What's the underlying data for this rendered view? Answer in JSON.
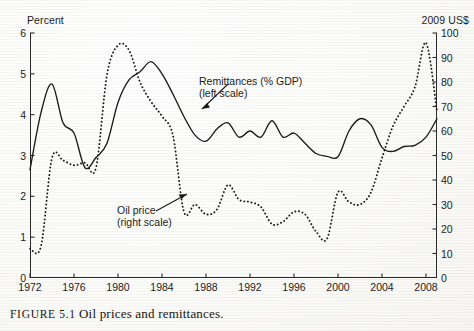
{
  "figure": {
    "caption_label": "FIGURE 5.1",
    "caption_text": "Oil prices and remittances."
  },
  "annotations": {
    "remittances": {
      "line1": "Remittances (% GDP)",
      "line2": "(left scale)"
    },
    "oil": {
      "line1": "Oil price",
      "line2": "(right scale)"
    }
  },
  "chart_data": {
    "type": "line",
    "title": "Oil prices and remittances",
    "xlabel": "",
    "ylabel": "Percent",
    "y2label": "2009 US$",
    "xlim": [
      1972,
      2009
    ],
    "ylim": [
      0,
      6
    ],
    "y2lim": [
      0,
      100
    ],
    "xticks": [
      1972,
      1976,
      1980,
      1984,
      1988,
      1992,
      1996,
      2000,
      2004,
      2008
    ],
    "yticks": [
      0,
      1,
      2,
      3,
      4,
      5,
      6
    ],
    "y2ticks": [
      0,
      10,
      20,
      30,
      40,
      50,
      60,
      70,
      80,
      90,
      100
    ],
    "grid": false,
    "legend": "annotations-inline",
    "x": [
      1972,
      1973,
      1974,
      1975,
      1976,
      1977,
      1978,
      1979,
      1980,
      1981,
      1982,
      1983,
      1984,
      1985,
      1986,
      1987,
      1988,
      1989,
      1990,
      1991,
      1992,
      1993,
      1994,
      1995,
      1996,
      1997,
      1998,
      1999,
      2000,
      2001,
      2002,
      2003,
      2004,
      2005,
      2006,
      2007,
      2008,
      2009
    ],
    "series": [
      {
        "name": "Remittances (% GDP)",
        "axis": "left",
        "style": "solid",
        "units": "percent of GDP",
        "values": [
          2.65,
          4.05,
          4.75,
          3.8,
          3.55,
          2.7,
          2.95,
          3.3,
          4.3,
          4.85,
          5.05,
          5.3,
          5.0,
          4.5,
          3.95,
          3.5,
          3.35,
          3.65,
          3.8,
          3.45,
          3.6,
          3.45,
          3.85,
          3.45,
          3.55,
          3.3,
          3.05,
          2.98,
          2.97,
          3.6,
          3.9,
          3.75,
          3.2,
          3.1,
          3.22,
          3.25,
          3.45,
          3.9
        ]
      },
      {
        "name": "Oil price",
        "axis": "right",
        "style": "dotted",
        "units": "2009 US$ per barrel",
        "values": [
          12,
          13,
          49,
          48,
          46,
          47,
          45,
          83,
          95,
          93,
          80,
          72,
          66,
          58,
          27,
          30,
          26,
          28,
          38,
          32,
          31,
          29,
          22,
          23,
          27,
          26,
          19,
          16,
          35,
          31,
          30,
          35,
          49,
          62,
          70,
          78,
          96,
          68
        ]
      }
    ]
  }
}
